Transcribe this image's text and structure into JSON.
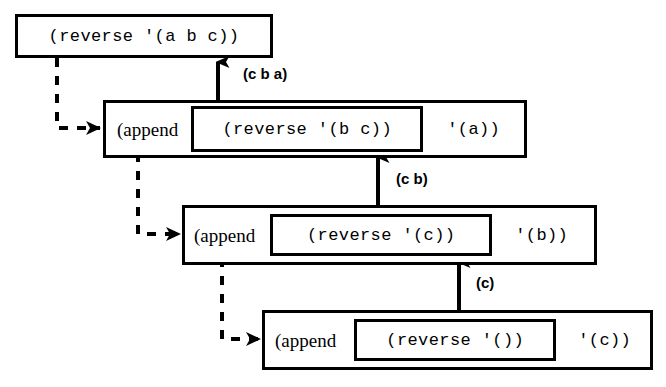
{
  "diagram": {
    "colors": {
      "stroke": "#000000",
      "background": "#ffffff",
      "text": "#000000"
    },
    "frames": [
      {
        "id": "frame-0",
        "kind": "call",
        "text": "(reverse '(a b c))",
        "x": 15,
        "y": 14,
        "w": 258,
        "h": 44
      },
      {
        "id": "frame-1",
        "kind": "append",
        "fn": "(append",
        "inner": "(reverse '(b c))",
        "tail": "'(a))",
        "x": 103,
        "y": 100,
        "w": 424,
        "h": 58,
        "inner_x": 111,
        "inner_w": 232
      },
      {
        "id": "frame-2",
        "kind": "append",
        "fn": "(append",
        "inner": "(reverse '(c))",
        "tail": "'(b))",
        "x": 182,
        "y": 205,
        "w": 415,
        "h": 60,
        "inner_x": 106,
        "inner_w": 222
      },
      {
        "id": "frame-3",
        "kind": "append",
        "fn": "(append",
        "inner": "(reverse '())",
        "tail": "'(c))",
        "x": 262,
        "y": 310,
        "w": 391,
        "h": 60,
        "inner_x": 108,
        "inner_w": 202
      }
    ],
    "return_labels": [
      {
        "id": "label-cba",
        "text": "(c b a)",
        "x": 243,
        "y": 66
      },
      {
        "id": "label-cb",
        "text": "(c b)",
        "x": 396,
        "y": 171
      },
      {
        "id": "label-c",
        "text": "(c)",
        "x": 476,
        "y": 275
      }
    ],
    "call_arrows": [
      {
        "id": "call-arrow-1",
        "from_frame": "frame-0",
        "to_frame": "frame-1",
        "vx": 57,
        "vy0": 58,
        "vy1": 128,
        "hx1": 100,
        "y": 128
      },
      {
        "id": "call-arrow-2",
        "from_frame": "frame-1",
        "to_frame": "frame-2",
        "vx": 138,
        "vy0": 153,
        "vy1": 234,
        "hx1": 180,
        "y": 234
      },
      {
        "id": "call-arrow-3",
        "from_frame": "frame-2",
        "to_frame": "frame-3",
        "vx": 222,
        "vy0": 258,
        "vy1": 339,
        "hx1": 260,
        "y": 339
      }
    ],
    "return_arrows": [
      {
        "id": "return-arrow-1",
        "x": 218,
        "y_from": 100,
        "y_to": 60
      },
      {
        "id": "return-arrow-2",
        "x": 378,
        "y_from": 205,
        "y_to": 155
      },
      {
        "id": "return-arrow-3",
        "x": 459,
        "y_from": 310,
        "y_to": 260
      }
    ],
    "dash_stubs": [
      {
        "id": "dash-stub-1",
        "x0": 133,
        "x1": 205,
        "y": 152
      },
      {
        "id": "dash-stub-2",
        "x0": 213,
        "x1": 280,
        "y": 257
      }
    ]
  }
}
